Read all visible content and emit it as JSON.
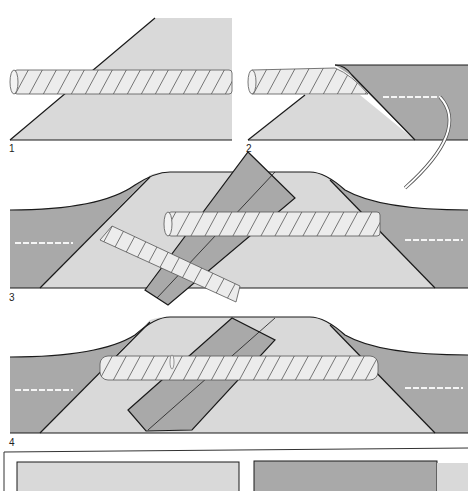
{
  "figure": {
    "steps": [
      {
        "label": "1"
      },
      {
        "label": "2"
      },
      {
        "label": "3"
      },
      {
        "label": "4"
      }
    ]
  },
  "colors": {
    "light_fabric": "#d9d9d9",
    "dark_fabric": "#a9a9a9",
    "cord": "#ececec",
    "outline": "#1a1a1a",
    "background": "#ffffff"
  }
}
